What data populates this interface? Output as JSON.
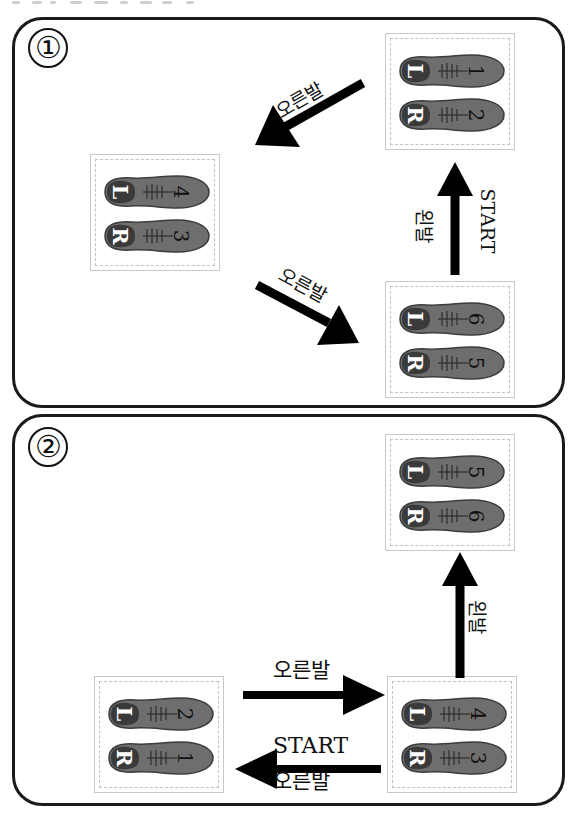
{
  "diagrams": [
    {
      "number": "①",
      "cards": [
        {
          "position": "top-right",
          "shoes": [
            {
              "side": "L",
              "step": "1"
            },
            {
              "side": "R",
              "step": "2"
            }
          ]
        },
        {
          "position": "left",
          "shoes": [
            {
              "side": "L",
              "step": "4"
            },
            {
              "side": "R",
              "step": "3"
            }
          ]
        },
        {
          "position": "bottom-right",
          "shoes": [
            {
              "side": "L",
              "step": "6"
            },
            {
              "side": "R",
              "step": "5"
            }
          ]
        }
      ],
      "arrows": [
        {
          "direction": "down-left",
          "label": "오른발"
        },
        {
          "direction": "up",
          "label": "왼발",
          "label2": "START"
        },
        {
          "direction": "down-right",
          "label": "오른발"
        }
      ]
    },
    {
      "number": "②",
      "cards": [
        {
          "position": "top-right",
          "shoes": [
            {
              "side": "L",
              "step": "5"
            },
            {
              "side": "R",
              "step": "6"
            }
          ]
        },
        {
          "position": "bottom-left",
          "shoes": [
            {
              "side": "L",
              "step": "2"
            },
            {
              "side": "R",
              "step": "1"
            }
          ]
        },
        {
          "position": "bottom-right",
          "shoes": [
            {
              "side": "L",
              "step": "4"
            },
            {
              "side": "R",
              "step": "3"
            }
          ]
        }
      ],
      "arrows": [
        {
          "direction": "up",
          "label": "왼발"
        },
        {
          "direction": "right",
          "label": "오른발"
        },
        {
          "direction": "left",
          "label": "START",
          "label2": "오른발"
        }
      ]
    }
  ],
  "colors": {
    "shoe": "#6e6e6e",
    "shoe_heel": "#3a3a3a",
    "border": "#1a1a1a",
    "card_border": "#c2c2c2"
  }
}
